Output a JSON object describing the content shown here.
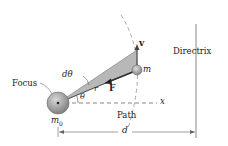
{
  "labels": {
    "focus": "Focus",
    "directrix": "Directrix",
    "path": "Path",
    "d_theta": "dθ",
    "theta": "θ",
    "r": "r",
    "force": "F",
    "velocity": "v",
    "mass": "m",
    "central_mass": "m",
    "central_mass_sub": "0",
    "x_axis": "x",
    "distance": "d"
  },
  "colors": {
    "sector_fill": "#b8b8b8",
    "focus_body": "#9a9a9a",
    "line": "#555555",
    "dashed": "#9a9a9a"
  }
}
